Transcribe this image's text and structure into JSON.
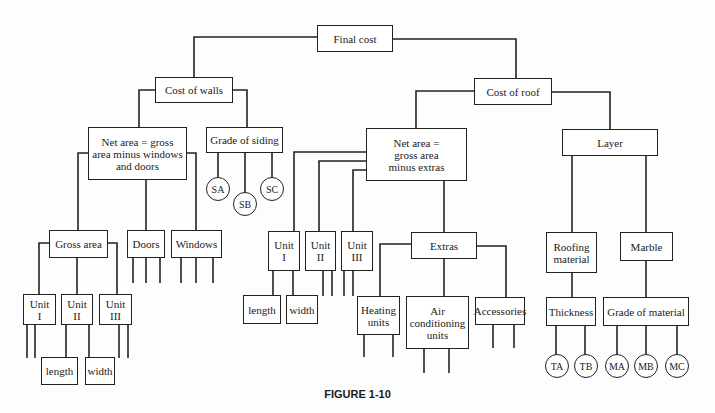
{
  "diagram": {
    "caption": "FIGURE 1-10",
    "nodes": {
      "final_cost": "Final cost",
      "cost_walls": "Cost of walls",
      "cost_roof": "Cost of roof",
      "net_area_walls": "Net area = gross\narea minus windows\nand doors",
      "grade_siding": "Grade of siding",
      "sa": "SA",
      "sb": "SB",
      "sc": "SC",
      "gross_area": "Gross area",
      "doors": "Doors",
      "windows": "Windows",
      "w_unit1": "Unit\nI",
      "w_unit2": "Unit\nII",
      "w_unit3": "Unit\nIII",
      "w_length": "length",
      "w_width": "width",
      "net_area_roof": "Net area =\ngross area\nminus extras",
      "layer": "Layer",
      "r_unit1": "Unit\nI",
      "r_unit2": "Unit\nII",
      "r_unit3": "Unit\nIII",
      "r_length": "length",
      "r_width": "width",
      "extras": "Extras",
      "heating": "Heating\nunits",
      "aircon": "Air\nconditioning\nunits",
      "accessories": "Accessories",
      "roofing_material": "Roofing\nmaterial",
      "marble": "Marble",
      "thickness": "Thickness",
      "grade_material": "Grade of material",
      "ta": "TA",
      "tb": "TB",
      "ma": "MA",
      "mb": "MB",
      "mc": "MC"
    }
  }
}
